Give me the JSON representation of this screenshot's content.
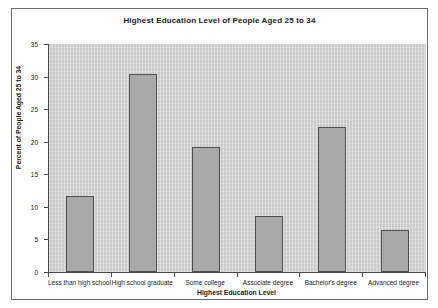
{
  "chart_data": {
    "type": "bar",
    "title": "Highest Education Level of People Aged 25 to 34",
    "xlabel": "Highest Education Level",
    "ylabel": "Percent of People Aged 25 to 34",
    "categories": [
      "Less than high school",
      "High school graduate",
      "Some college",
      "Associate degree",
      "Bachelor's degree",
      "Advanced degree"
    ],
    "values": [
      11.7,
      30.4,
      19.2,
      8.6,
      22.2,
      6.4
    ],
    "ylim": [
      0,
      35
    ],
    "ytick_labels": [
      "0",
      "5",
      "10",
      "15",
      "20",
      "25",
      "30",
      "35"
    ],
    "ytick_values": [
      0,
      5,
      10,
      15,
      20,
      25,
      30,
      35
    ],
    "grid": false,
    "legend": null,
    "colors": {
      "bar_fill": "#a9a9a9",
      "bar_border": "#4f4f4f",
      "plot_background": "#d2d2d2",
      "figure_background": "#ffffff",
      "axis": "#4a4a4a",
      "text": "#1c1c1c"
    }
  }
}
